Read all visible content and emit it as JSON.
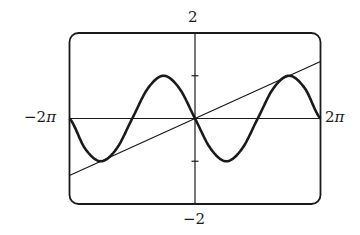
{
  "chart_data": {
    "type": "line",
    "title": "",
    "xlabel": "",
    "ylabel": "",
    "xlim": [
      -6.283185,
      6.283185
    ],
    "ylim": [
      -2,
      2
    ],
    "xlim_labels": {
      "min": "−2",
      "min_suffix": "π",
      "max": "2",
      "max_suffix": "π"
    },
    "ylim_labels": {
      "max": "2",
      "min": "−2"
    },
    "grid": false,
    "legend": null,
    "y_ticks": [
      -1,
      1
    ],
    "series": [
      {
        "name": "y = −sin x",
        "style": "thick",
        "x": [
          -6.2832,
          -5.4978,
          -4.7124,
          -3.927,
          -3.1416,
          -2.3562,
          -1.5708,
          -0.7854,
          0,
          0.7854,
          1.5708,
          2.3562,
          3.1416,
          3.927,
          4.7124,
          5.4978,
          6.2832
        ],
        "values": [
          0,
          -0.707,
          -1,
          -0.707,
          0,
          0.707,
          1,
          0.707,
          0,
          -0.707,
          -1,
          -0.707,
          0,
          0.707,
          1,
          0.707,
          0
        ]
      },
      {
        "name": "y = 2x/(3π)",
        "style": "thin",
        "x": [
          -6.2832,
          6.2832
        ],
        "values": [
          -1.333,
          1.333
        ]
      }
    ]
  },
  "labels": {
    "y_max": "2",
    "y_min": "−2",
    "x_min": "−2",
    "x_max": "2",
    "pi": "π"
  },
  "colors": {
    "ink": "#1a1a1a",
    "background": "#ffffff"
  }
}
